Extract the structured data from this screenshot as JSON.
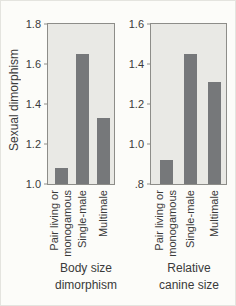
{
  "figure": {
    "y_axis_label": "Sexual dimorphism"
  },
  "chart_data": [
    {
      "type": "bar",
      "title": "Body size\ndimorphism",
      "categories": [
        "Pair living or\nmonogamous",
        "Single-male",
        "Multimale"
      ],
      "values": [
        1.08,
        1.65,
        1.33
      ],
      "ylim": [
        1.0,
        1.8
      ],
      "yticks": [
        "1.8",
        "1.6",
        "1.4",
        "1.2",
        "1.0"
      ],
      "ylabel": "Sexual dimorphism",
      "legend": "none",
      "grid": "off",
      "bar_color": "#76787a",
      "plot_bg": "#e9e9e5"
    },
    {
      "type": "bar",
      "title": "Relative\ncanine size",
      "categories": [
        "Pair living or\nmonogamous",
        "Single-male",
        "Multimale"
      ],
      "values": [
        0.92,
        1.45,
        1.31
      ],
      "ylim": [
        0.8,
        1.6
      ],
      "yticks": [
        "1.6",
        "1.4",
        "1.2",
        "1.0",
        ".8"
      ],
      "ylabel": "Sexual dimorphism",
      "legend": "none",
      "grid": "off",
      "bar_color": "#76787a",
      "plot_bg": "#e9e9e5"
    }
  ]
}
